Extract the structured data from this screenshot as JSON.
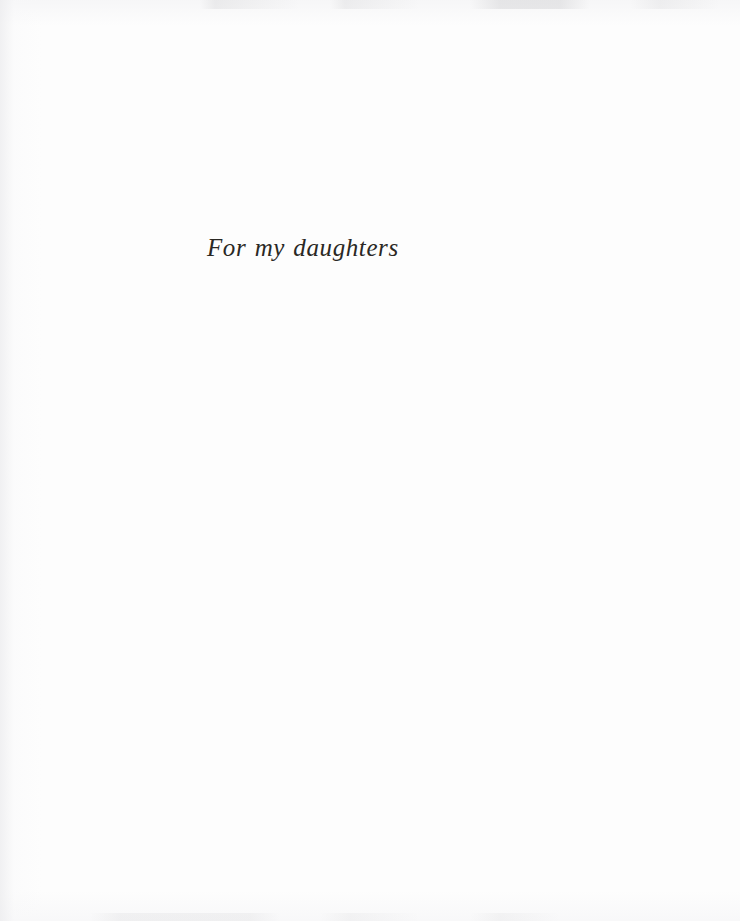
{
  "page": {
    "kind": "book-dedication-page",
    "background_color": "#fdfdfd",
    "width": 740,
    "height": 921
  },
  "dedication": {
    "text": "For my daughters",
    "ink_color": "#2a2824",
    "style": "italic serif",
    "alignment": "left-of-center"
  },
  "artifacts": {
    "top_edge_label": "scan bleed marks along top edge",
    "bottom_edge_label": "scan bleed marks along bottom edge",
    "gutter_label": "binding gutter shading at left edge"
  }
}
